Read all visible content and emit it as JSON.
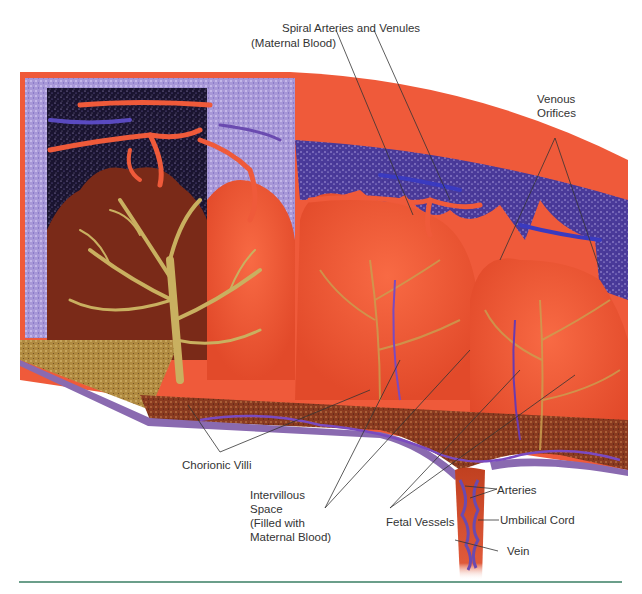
{
  "figure": {
    "labels": {
      "spiral_arteries": "Spiral Arteries and Venules",
      "maternal_blood": "(Maternal Blood)",
      "venous_1": "Venous",
      "venous_2": "Orifices",
      "chorionic_villi": "Chorionic Villi",
      "intervillous_1": "Intervillous",
      "intervillous_2": "Space",
      "intervillous_3": "(Filled with",
      "intervillous_4": "Maternal Blood)",
      "fetal_vessels": "Fetal Vessels",
      "arteries": "Arteries",
      "umbilical_cord": "Umbilical Cord",
      "vein": "Vein"
    },
    "colors": {
      "maternal_tissue": "#ef5a3a",
      "decidua_purple": "#4a3a9a",
      "dark_space": "#1a1430",
      "villi_gold": "#c9b060",
      "chorionic_brown": "#7a2a18",
      "plate_speckle": "#8a4a20",
      "membrane_purple": "#8a6ab0",
      "rule_green": "#6b9e8a",
      "label_text": "#333333"
    }
  }
}
